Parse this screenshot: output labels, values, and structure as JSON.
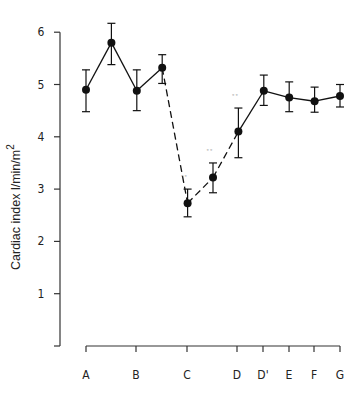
{
  "chart_data": {
    "type": "line",
    "title": "",
    "xlabel": "",
    "ylabel": "Cardiac index l/min/m",
    "ylabel_superscript": "2",
    "ylim": [
      0,
      6
    ],
    "yticks": [
      1,
      2,
      3,
      4,
      5,
      6
    ],
    "grid": false,
    "legend": null,
    "categories": [
      "A",
      "B",
      "C",
      "D",
      "D'",
      "E",
      "F",
      "G"
    ],
    "points": [
      {
        "x": "A",
        "pos": 0,
        "value": 4.9,
        "err_low": 4.48,
        "err_high": 5.28,
        "significance": ""
      },
      {
        "x": "A-B",
        "pos": 0.5,
        "value": 5.8,
        "err_low": 5.38,
        "err_high": 6.17,
        "significance": ""
      },
      {
        "x": "B",
        "pos": 1,
        "value": 4.88,
        "err_low": 4.5,
        "err_high": 5.28,
        "significance": ""
      },
      {
        "x": "B-C",
        "pos": 1.5,
        "value": 5.32,
        "err_low": 5.02,
        "err_high": 5.57,
        "significance": ""
      },
      {
        "x": "C",
        "pos": 2,
        "value": 2.73,
        "err_low": 2.47,
        "err_high": 3.0,
        "significance": "oo"
      },
      {
        "x": "C-D",
        "pos": 2.5,
        "value": 3.22,
        "err_low": 2.93,
        "err_high": 3.5,
        "significance": "oo"
      },
      {
        "x": "D",
        "pos": 3,
        "value": 4.1,
        "err_low": 3.6,
        "err_high": 4.55,
        "significance": "oo"
      },
      {
        "x": "D'",
        "pos": 3.5,
        "value": 4.88,
        "err_low": 4.6,
        "err_high": 5.18,
        "significance": ""
      },
      {
        "x": "E",
        "pos": 4,
        "value": 4.75,
        "err_low": 4.48,
        "err_high": 5.05,
        "significance": ""
      },
      {
        "x": "F",
        "pos": 4.5,
        "value": 4.68,
        "err_low": 4.47,
        "err_high": 4.95,
        "significance": ""
      },
      {
        "x": "G",
        "pos": 5,
        "value": 4.78,
        "err_low": 4.57,
        "err_high": 5.0,
        "significance": ""
      }
    ],
    "dashed_segments": [
      [
        3,
        4
      ],
      [
        4,
        5
      ],
      [
        5,
        6
      ]
    ],
    "annotations": [
      "oo marks significant difference at C, C-D midpoint and D"
    ]
  },
  "layout": {
    "x_axis_ticks_px": {
      "A": 86,
      "B": 136,
      "C": 187,
      "D": 237,
      "D'": 263,
      "E": 289,
      "F": 314,
      "G": 340
    }
  }
}
